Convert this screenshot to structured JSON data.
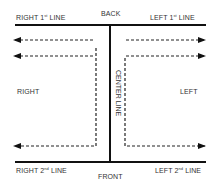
{
  "labels": {
    "back": "BACK",
    "front": "FRONT",
    "right_1st": {
      "text": "RIGHT 1",
      "sup": "st",
      "suffix": " LINE"
    },
    "left_1st": {
      "text": "LEFT 1",
      "sup": "st",
      "suffix": " LINE"
    },
    "right_2nd": {
      "text": "RIGHT 2",
      "sup": "nd",
      "suffix": " LINE"
    },
    "left_2nd": {
      "text": "LEFT 2",
      "sup": "nd",
      "suffix": " LINE"
    },
    "right": "RIGHT",
    "left": "LEFT",
    "center_line": "CENTER LINE"
  },
  "colors": {
    "line": "#111111",
    "dashed": "#222222",
    "text": "#333333"
  }
}
